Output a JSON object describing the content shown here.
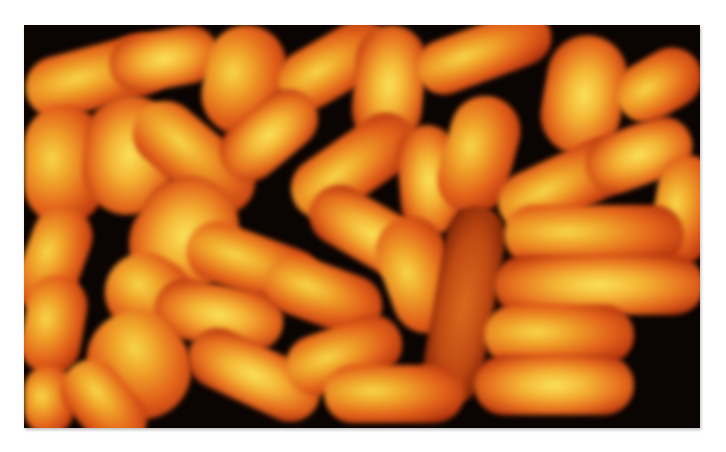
{
  "image": {
    "subject": "fluorescence micrograph of rod-shaped bacteria",
    "colors": {
      "background": "#0a0402",
      "cell_core": "#f7d64a",
      "cell_mid": "#e2611a",
      "cell_edge": "#b8360e",
      "page": "#ffffff"
    },
    "cells": [
      {
        "x": 0,
        "y": 20,
        "w": 150,
        "h": 62,
        "r": -15,
        "t": ""
      },
      {
        "x": 85,
        "y": 5,
        "w": 110,
        "h": 58,
        "r": -10,
        "t": "bright"
      },
      {
        "x": 180,
        "y": 0,
        "w": 80,
        "h": 110,
        "r": 10,
        "t": ""
      },
      {
        "x": 250,
        "y": 10,
        "w": 120,
        "h": 60,
        "r": -30,
        "t": ""
      },
      {
        "x": 330,
        "y": 0,
        "w": 70,
        "h": 120,
        "r": 5,
        "t": "bright"
      },
      {
        "x": 390,
        "y": 0,
        "w": 140,
        "h": 55,
        "r": -20,
        "t": ""
      },
      {
        "x": 520,
        "y": 10,
        "w": 80,
        "h": 120,
        "r": 10,
        "t": "bright"
      },
      {
        "x": 590,
        "y": 30,
        "w": 90,
        "h": 60,
        "r": -30,
        "t": ""
      },
      {
        "x": 0,
        "y": 80,
        "w": 80,
        "h": 120,
        "r": 0,
        "t": ""
      },
      {
        "x": 60,
        "y": 70,
        "w": 90,
        "h": 120,
        "r": 5,
        "t": "bright"
      },
      {
        "x": 100,
        "y": 100,
        "w": 140,
        "h": 65,
        "r": 40,
        "t": ""
      },
      {
        "x": 190,
        "y": 80,
        "w": 110,
        "h": 60,
        "r": -40,
        "t": "bright"
      },
      {
        "x": 260,
        "y": 110,
        "w": 140,
        "h": 62,
        "r": -35,
        "t": ""
      },
      {
        "x": 375,
        "y": 100,
        "w": 60,
        "h": 110,
        "r": -5,
        "t": "bright"
      },
      {
        "x": 420,
        "y": 70,
        "w": 70,
        "h": 120,
        "r": 15,
        "t": ""
      },
      {
        "x": 470,
        "y": 130,
        "w": 140,
        "h": 60,
        "r": -25,
        "t": ""
      },
      {
        "x": 560,
        "y": 100,
        "w": 110,
        "h": 60,
        "r": -20,
        "t": "bright"
      },
      {
        "x": 630,
        "y": 130,
        "w": 60,
        "h": 110,
        "r": 10,
        "t": ""
      },
      {
        "x": 0,
        "y": 180,
        "w": 60,
        "h": 110,
        "r": 20,
        "t": ""
      },
      {
        "x": 110,
        "y": 150,
        "w": 100,
        "h": 120,
        "r": 30,
        "t": "bright"
      },
      {
        "x": 160,
        "y": 210,
        "w": 140,
        "h": 60,
        "r": 20,
        "t": ""
      },
      {
        "x": 280,
        "y": 180,
        "w": 140,
        "h": 60,
        "r": 30,
        "t": "bright"
      },
      {
        "x": 360,
        "y": 190,
        "w": 70,
        "h": 120,
        "r": -20,
        "t": ""
      },
      {
        "x": 410,
        "y": 180,
        "w": 60,
        "h": 200,
        "r": 10,
        "t": "dim"
      },
      {
        "x": 480,
        "y": 180,
        "w": 180,
        "h": 60,
        "r": 0,
        "t": ""
      },
      {
        "x": 470,
        "y": 230,
        "w": 210,
        "h": 60,
        "r": 0,
        "t": "bright"
      },
      {
        "x": 0,
        "y": 250,
        "w": 60,
        "h": 100,
        "r": 10,
        "t": ""
      },
      {
        "x": 80,
        "y": 230,
        "w": 90,
        "h": 80,
        "r": 30,
        "t": ""
      },
      {
        "x": 130,
        "y": 260,
        "w": 130,
        "h": 60,
        "r": 10,
        "t": "bright"
      },
      {
        "x": 240,
        "y": 240,
        "w": 120,
        "h": 60,
        "r": 20,
        "t": ""
      },
      {
        "x": 60,
        "y": 290,
        "w": 110,
        "h": 100,
        "r": 60,
        "t": ""
      },
      {
        "x": 160,
        "y": 320,
        "w": 140,
        "h": 60,
        "r": 25,
        "t": "bright"
      },
      {
        "x": 260,
        "y": 300,
        "w": 120,
        "h": 60,
        "r": -20,
        "t": ""
      },
      {
        "x": 300,
        "y": 340,
        "w": 140,
        "h": 58,
        "r": 0,
        "t": ""
      },
      {
        "x": 460,
        "y": 280,
        "w": 150,
        "h": 60,
        "r": 0,
        "t": ""
      },
      {
        "x": 450,
        "y": 330,
        "w": 160,
        "h": 60,
        "r": 0,
        "t": "bright"
      },
      {
        "x": 0,
        "y": 340,
        "w": 50,
        "h": 70,
        "r": 0,
        "t": ""
      },
      {
        "x": 30,
        "y": 350,
        "w": 100,
        "h": 60,
        "r": 50,
        "t": ""
      }
    ]
  }
}
